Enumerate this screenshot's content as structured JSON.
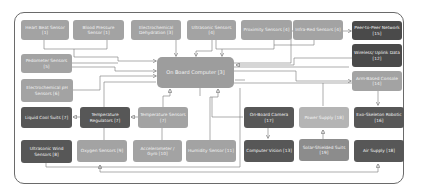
{
  "diagram": {
    "title": "",
    "nodes": [
      {
        "id": "heart-beat",
        "label": "Heart Beat Sensor [1]",
        "shade": "light"
      },
      {
        "id": "blood-pressure",
        "label": "Blood Pressure Sensor [1]",
        "shade": "light"
      },
      {
        "id": "electrochemical-dehydration",
        "label": "Electrochemical Dehydration [3]",
        "shade": "light"
      },
      {
        "id": "ultrasonic-sensors",
        "label": "Ultrasonic Sensors [4]",
        "shade": "light"
      },
      {
        "id": "proximity-sensors",
        "label": "Proximity Sensors [4]",
        "shade": "light"
      },
      {
        "id": "infra-red-sensors",
        "label": "Infra-Red Sensors [4]",
        "shade": "light"
      },
      {
        "id": "peer-to-peer",
        "label": "Peer-to-Peer Network [15]",
        "shade": "dark"
      },
      {
        "id": "wireless-uplink",
        "label": "Wireless/ Uplink Data [12]",
        "shade": "dark"
      },
      {
        "id": "arm-console",
        "label": "Arm-Based Console [14]",
        "shade": "light"
      },
      {
        "id": "pedometer",
        "label": "Pedometer Sensors [5]",
        "shade": "light"
      },
      {
        "id": "electrochemical-ph",
        "label": "Electrochemical pH Sensors [6]",
        "shade": "light"
      },
      {
        "id": "on-board-computer",
        "label": "On Board Computer [3]",
        "shade": "main"
      },
      {
        "id": "liquid-cool",
        "label": "Liquid Cool Suits [7]",
        "shade": "dark"
      },
      {
        "id": "temp-regulators",
        "label": "Temperature Regulators [7]",
        "shade": "dark"
      },
      {
        "id": "temp-sensors",
        "label": "Temperature Sensors [7]",
        "shade": "light"
      },
      {
        "id": "onboard-camera",
        "label": "On-Board Camera [17]",
        "shade": "dark"
      },
      {
        "id": "power-supply",
        "label": "Power Supply [18]",
        "shade": "lighter"
      },
      {
        "id": "exo-skeleton",
        "label": "Exo-Skeleton Robotic [16]",
        "shade": "dark"
      },
      {
        "id": "ultrasonic-wind",
        "label": "Ultrasonic Wind Sensors [8]",
        "shade": "dark"
      },
      {
        "id": "oxygen-sensors",
        "label": "Oxygen Sensors [9]",
        "shade": "light"
      },
      {
        "id": "accelerometer",
        "label": "Accelerometer / Gyro [10]",
        "shade": "light"
      },
      {
        "id": "humidity",
        "label": "Humidity Sensor [11]",
        "shade": "light"
      },
      {
        "id": "computer-vision",
        "label": "Computer Vision [13]",
        "shade": "dark"
      },
      {
        "id": "solar-suits",
        "label": "Solar-Shielded Suits [19]",
        "shade": "mid"
      },
      {
        "id": "air-supply",
        "label": "Air Supply [18]",
        "shade": "dark"
      }
    ]
  }
}
